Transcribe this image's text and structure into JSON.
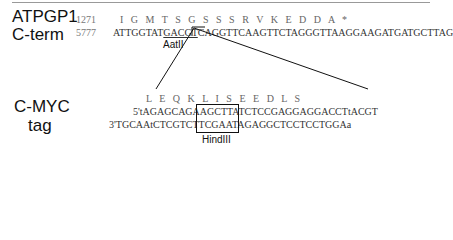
{
  "top": {
    "label_line1": "ATPGP1",
    "label_line2": "C-term",
    "aa_position": "1271",
    "nt_position": "5777",
    "aa_sequence": "I   G   M   T   S   G   S   S   S   R   V   K   E   D   D   A   *",
    "nt_prefix": "ATTGGTAT",
    "nt_site": "GACGT",
    "nt_suffix": "CAGGTTCAAGTTCTAGGGTTAAGGAAGATGATGCTTAG",
    "site_name": "AatII"
  },
  "bottom": {
    "label_line1": "C-MYC",
    "label_line2": "tag",
    "aa_sequence": "L   E   Q   K   L   I   S   E   E   D   L   S",
    "strand_top": "5'tAGAGCAGAAGCTTATCTCCGAGGAGGACCTtACGT",
    "strand_bottom": "3'TGCAAtCTCGTCTTCGAATAGAGGCTCCTCCTGGAa",
    "site_name": "HindIII"
  }
}
